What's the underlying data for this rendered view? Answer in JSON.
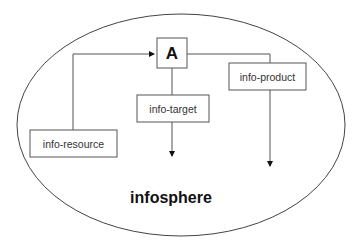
{
  "diagram": {
    "type": "flow-diagram",
    "container": {
      "label": "infosphere",
      "shape": "ellipse"
    },
    "nodes": [
      {
        "id": "A",
        "label": "A"
      },
      {
        "id": "info-resource",
        "label": "info-resource"
      },
      {
        "id": "info-target",
        "label": "info-target"
      },
      {
        "id": "info-product",
        "label": "info-product"
      }
    ],
    "edges": [
      {
        "from": "info-resource",
        "to": "A",
        "arrow": true
      },
      {
        "from": "A",
        "to": "info-target",
        "arrow": false
      },
      {
        "from": "info-target",
        "to": "down",
        "arrow": true
      },
      {
        "from": "A",
        "to": "info-product",
        "arrow": false
      },
      {
        "from": "info-product",
        "to": "down",
        "arrow": true
      }
    ],
    "colors": {
      "stroke": "#555555",
      "ellipse_stroke": "#444444",
      "text": "#111111",
      "background": "#ffffff"
    }
  }
}
